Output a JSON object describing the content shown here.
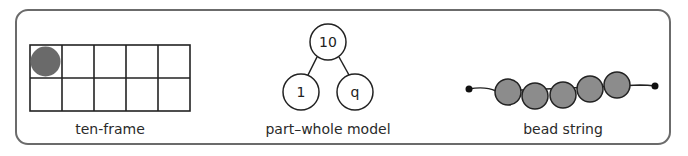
{
  "colors": {
    "stroke": "#222222",
    "counter": "#6a6a6a",
    "bead": "#8c8c8c",
    "border": "#6b6b6b"
  },
  "models": [
    {
      "id": "ten-frame",
      "label": "ten-frame",
      "rows": 2,
      "cols": 5,
      "filled_cells": [
        [
          0,
          0
        ]
      ]
    },
    {
      "id": "part-whole",
      "label": "part–whole model",
      "whole": "10",
      "parts": [
        "1",
        "9"
      ],
      "parts_display": [
        "1",
        "q"
      ]
    },
    {
      "id": "bead-string",
      "label": "bead string",
      "bead_count": 5
    }
  ]
}
